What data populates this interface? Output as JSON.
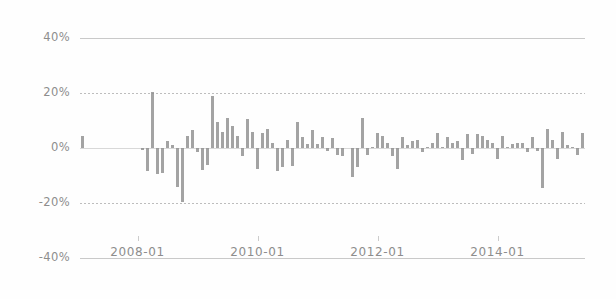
{
  "chart_data": {
    "type": "bar",
    "title": "",
    "subtitle": "",
    "xlabel": "",
    "ylabel": "",
    "ylim": [
      -40,
      40
    ],
    "grid": true,
    "legend": null,
    "ytick_labels": [
      "40%",
      "20%",
      "0%",
      "-20%",
      "-40%"
    ],
    "ytick_values": [
      40,
      20,
      0,
      -20,
      -40
    ],
    "xtick_labels": [
      "2008-01",
      "2010-01",
      "2012-01",
      "2014-01"
    ],
    "xtick_categories": [
      "2008-01",
      "2010-01",
      "2012-01",
      "2014-01"
    ],
    "bar_color": "#8f8f8f",
    "grid_color": "#c9c9c9",
    "text_color": "#8d8d8d",
    "x_start": "2007-02",
    "x_end": "2015-06",
    "categories": [
      "2007-02",
      "2007-03",
      "2007-04",
      "2007-05",
      "2007-06",
      "2007-07",
      "2007-08",
      "2007-09",
      "2007-10",
      "2007-11",
      "2007-12",
      "2008-01",
      "2008-02",
      "2008-03",
      "2008-04",
      "2008-05",
      "2008-06",
      "2008-07",
      "2008-08",
      "2008-09",
      "2008-10",
      "2008-11",
      "2008-12",
      "2009-01",
      "2009-02",
      "2009-03",
      "2009-04",
      "2009-05",
      "2009-06",
      "2009-07",
      "2009-08",
      "2009-09",
      "2009-10",
      "2009-11",
      "2009-12",
      "2010-01",
      "2010-02",
      "2010-03",
      "2010-04",
      "2010-05",
      "2010-06",
      "2010-07",
      "2010-08",
      "2010-09",
      "2010-10",
      "2010-11",
      "2010-12",
      "2011-01",
      "2011-02",
      "2011-03",
      "2011-04",
      "2011-05",
      "2011-06",
      "2011-07",
      "2011-08",
      "2011-09",
      "2011-10",
      "2011-11",
      "2011-12",
      "2012-01",
      "2012-02",
      "2012-03",
      "2012-04",
      "2012-05",
      "2012-06",
      "2012-07",
      "2012-08",
      "2012-09",
      "2012-10",
      "2012-11",
      "2012-12",
      "2013-01",
      "2013-02",
      "2013-03",
      "2013-04",
      "2013-05",
      "2013-06",
      "2013-07",
      "2013-08",
      "2013-09",
      "2013-10",
      "2013-11",
      "2013-12",
      "2014-01",
      "2014-02",
      "2014-03",
      "2014-04",
      "2014-05",
      "2014-06",
      "2014-07",
      "2014-08",
      "2014-09",
      "2014-10",
      "2014-11",
      "2014-12",
      "2015-01",
      "2015-02",
      "2015-03",
      "2015-04",
      "2015-05",
      "2015-06"
    ],
    "values": [
      4.5,
      0,
      0,
      0,
      0,
      0,
      0,
      0,
      0,
      0,
      0,
      0,
      -0.8,
      -8.5,
      20.5,
      -9.5,
      -9.0,
      2.5,
      1.2,
      -14.0,
      -19.5,
      4.5,
      6.5,
      -1.5,
      -8.0,
      -6.0,
      19.0,
      9.5,
      6.0,
      11.0,
      8.0,
      4.5,
      -3.0,
      10.5,
      6.0,
      -7.5,
      5.5,
      7.0,
      2.0,
      -8.5,
      -7.0,
      3.0,
      -6.5,
      9.5,
      4.0,
      1.5,
      6.5,
      1.5,
      4.0,
      -1.0,
      3.5,
      -2.5,
      -3.0,
      0,
      -10.5,
      -7.0,
      11.0,
      -2.5,
      0.5,
      5.5,
      4.5,
      2.0,
      -3.0,
      -7.5,
      4.0,
      1.0,
      2.5,
      3.0,
      -1.5,
      0.5,
      2.0,
      5.5,
      0.5,
      4.0,
      2.0,
      2.5,
      -4.5,
      5.0,
      -2.0,
      5.0,
      4.5,
      3.0,
      2.0,
      -4.0,
      4.5,
      0.5,
      1.5,
      2.0,
      2.0,
      -1.5,
      4.0,
      -1.0,
      -14.5,
      7.0,
      3.0,
      -4.0,
      6.0,
      1.0,
      0.5,
      -2.5,
      5.5
    ]
  }
}
